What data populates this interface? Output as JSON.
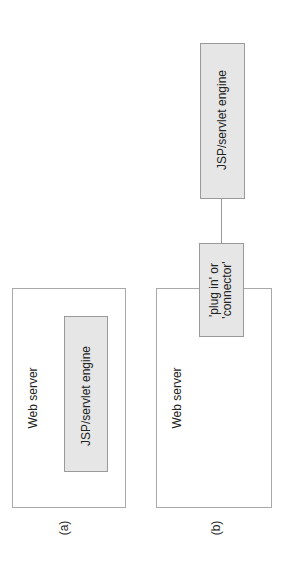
{
  "diagram": {
    "a": {
      "label": "(a)",
      "web_server": "Web server",
      "engine": "JSP/servlet engine"
    },
    "b": {
      "label": "(b)",
      "web_server": "Web server",
      "plugin_line1": "'plug in' or",
      "plugin_line2": "'connector'",
      "engine": "JSP/servlet engine"
    },
    "colors": {
      "engine_fill": "#e6e6e6",
      "border": "#a8a8a8",
      "background": "#ffffff"
    }
  }
}
